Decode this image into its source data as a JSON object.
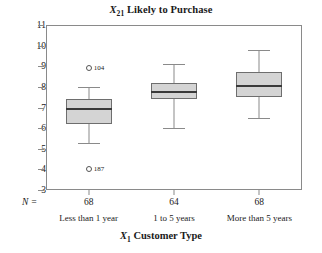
{
  "chart_data": {
    "type": "box",
    "title": "X21 Likely to Purchase",
    "title_prefix": "X",
    "title_subscript": "21",
    "title_suffix": " Likely to Purchase",
    "xlabel": "X1 Customer Type",
    "xlabel_prefix": "X",
    "xlabel_subscript": "1",
    "xlabel_suffix": " Customer Type",
    "ylabel": "",
    "ylim": [
      3,
      11
    ],
    "yticks": [
      3,
      4,
      5,
      6,
      7,
      8,
      9,
      10,
      11
    ],
    "grid": false,
    "legend": "none",
    "n_prefix": "N =",
    "categories": [
      "Less than 1 year",
      "1 to 5 years",
      "More than 5 years"
    ],
    "counts": [
      68,
      64,
      68
    ],
    "boxes": [
      {
        "category": "Less than 1 year",
        "n": 68,
        "whisker_low": 5.3,
        "q1": 6.2,
        "median": 7.0,
        "q3": 7.4,
        "whisker_high": 8.0,
        "outliers": [
          {
            "value": 8.9,
            "label": "104",
            "position": "upper"
          },
          {
            "value": 4.0,
            "label": "187",
            "position": "lower"
          }
        ]
      },
      {
        "category": "1 to 5 years",
        "n": 64,
        "whisker_low": 6.0,
        "q1": 7.4,
        "median": 7.8,
        "q3": 8.2,
        "whisker_high": 9.1,
        "outliers": []
      },
      {
        "category": "More than 5 years",
        "n": 68,
        "whisker_low": 6.5,
        "q1": 7.5,
        "median": 8.1,
        "q3": 8.7,
        "whisker_high": 9.8,
        "outliers": []
      }
    ],
    "colors": {
      "box_fill": "#d4d4d4",
      "box_border": "#6e6e6e",
      "median": "#3a3a3a",
      "whisker": "#8a8a8a",
      "frame": "#8a8a8a",
      "text": "#1a1a1a",
      "background": "#ffffff"
    }
  }
}
